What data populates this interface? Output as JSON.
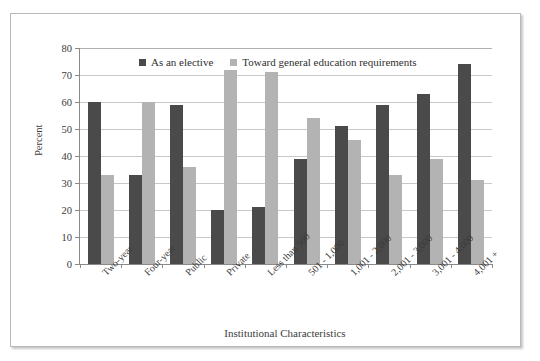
{
  "chart_data": {
    "type": "bar",
    "title": "",
    "xlabel": "Institutional Characteristics",
    "ylabel": "Percent",
    "ylim": [
      0,
      80
    ],
    "ytick_step": 10,
    "yticks": [
      0,
      10,
      20,
      30,
      40,
      50,
      60,
      70,
      80
    ],
    "grid": true,
    "legend_position": "top-center",
    "categories": [
      "Two-year",
      "Four-year",
      "Public",
      "Private",
      "Less than 500",
      "501 - 1,000",
      "1,001 - 2,000",
      "2,001 - 3,000",
      "3,001 - 4,000",
      "4,001 +"
    ],
    "series": [
      {
        "name": "As an elective",
        "color": "#4a4a4a",
        "values": [
          60,
          33,
          59,
          20,
          21,
          39,
          51,
          59,
          63,
          74
        ]
      },
      {
        "name": "Toward general education requirements",
        "color": "#b3b3b3",
        "values": [
          33,
          60,
          36,
          72,
          71,
          54,
          46,
          33,
          39,
          31
        ]
      }
    ]
  },
  "axes": {
    "y_title": "Percent",
    "x_title": "Institutional Characteristics"
  }
}
